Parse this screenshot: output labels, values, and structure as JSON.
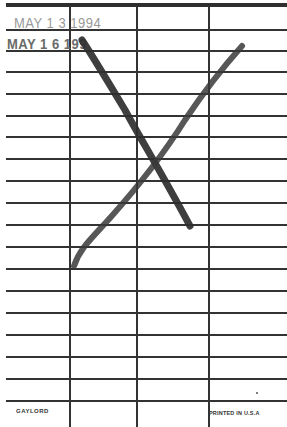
{
  "card": {
    "type": "library-due-date-card",
    "stamps": [
      {
        "text": "MAY 1 3 1994",
        "color": "#9a9a9a"
      },
      {
        "text": "MAY 1 6 199",
        "color": "#6a6a6a"
      }
    ],
    "footer": {
      "left": "GAYLORD",
      "right": "PRINTED IN U.S.A"
    },
    "grid": {
      "columns_x": [
        69,
        136,
        208
      ],
      "rows_y": [
        29,
        50,
        71,
        93,
        115,
        136,
        158,
        180,
        202,
        224,
        246,
        268,
        290,
        312,
        334,
        356,
        378,
        400
      ]
    },
    "mark": {
      "type": "x-cross",
      "color": "#333333"
    }
  }
}
